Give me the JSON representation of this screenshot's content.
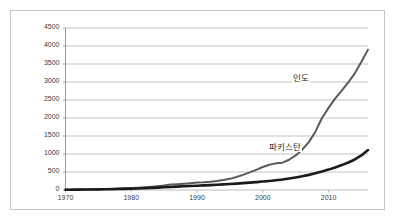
{
  "chart_data": {
    "type": "line",
    "title": "",
    "subtitle": "",
    "xlabel": "",
    "ylabel": "",
    "xlim": [
      1970,
      2016
    ],
    "ylim": [
      0,
      4500
    ],
    "grid": "horizontal",
    "legend_position": "inline-annotation",
    "x_ticks": [
      "1970",
      "1980",
      "1990",
      "2000",
      "2010"
    ],
    "x_tick_values": [
      1970,
      1980,
      1990,
      2000,
      2010
    ],
    "y_ticks": [
      "0",
      "500",
      "1000",
      "1500",
      "2000",
      "2500",
      "3000",
      "3500",
      "4000",
      "4500"
    ],
    "y_tick_values": [
      0,
      500,
      1000,
      1500,
      2000,
      2500,
      3000,
      3500,
      4000,
      4500
    ],
    "x": [
      1970,
      1971,
      1972,
      1973,
      1974,
      1975,
      1976,
      1977,
      1978,
      1979,
      1980,
      1981,
      1982,
      1983,
      1984,
      1985,
      1986,
      1987,
      1988,
      1989,
      1990,
      1991,
      1992,
      1993,
      1994,
      1995,
      1996,
      1997,
      1998,
      1999,
      2000,
      2001,
      2002,
      2003,
      2004,
      2005,
      2006,
      2007,
      2008,
      2009,
      2010,
      2011,
      2012,
      2013,
      2014,
      2015,
      2016
    ],
    "series": [
      {
        "name": "인도",
        "color": "#5a5a5a",
        "line_width": 2,
        "values": [
          10,
          12,
          14,
          17,
          20,
          24,
          28,
          33,
          39,
          46,
          54,
          64,
          76,
          90,
          107,
          127,
          150,
          163,
          176,
          190,
          205,
          215,
          230,
          250,
          275,
          310,
          360,
          420,
          490,
          560,
          640,
          700,
          740,
          760,
          840,
          960,
          1120,
          1330,
          1620,
          2000,
          2280,
          2540,
          2760,
          2990,
          3240,
          3560,
          3900
        ]
      },
      {
        "name": "파키스탄",
        "color": "#1a1a1a",
        "line_width": 2.6,
        "values": [
          8,
          9,
          10,
          12,
          14,
          16,
          19,
          22,
          26,
          30,
          35,
          41,
          48,
          56,
          65,
          75,
          85,
          95,
          105,
          112,
          120,
          128,
          136,
          145,
          155,
          165,
          178,
          192,
          206,
          220,
          236,
          252,
          270,
          292,
          318,
          348,
          382,
          420,
          464,
          512,
          566,
          626,
          692,
          765,
          848,
          960,
          1110
        ]
      }
    ],
    "annotations": [
      {
        "text": "인도",
        "x": 2007,
        "y": 3100
      },
      {
        "text": "파키스탄",
        "x": 2006,
        "y": 1200
      }
    ]
  }
}
